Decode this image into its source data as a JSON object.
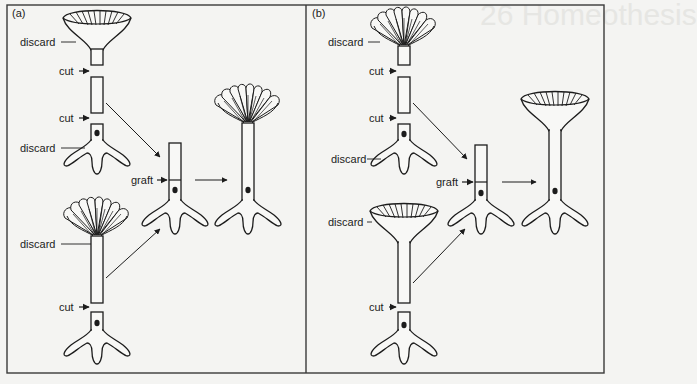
{
  "figure": {
    "colors": {
      "background": "#f4f4f2",
      "ink": "#1c1c1c",
      "frame": "#3a3a3a",
      "bleed_through": "#e6e6e3"
    },
    "bleed_through_heading": "26 Homeothesis",
    "panels": [
      {
        "id": "a",
        "label": "(a)",
        "top_cell": {
          "cap_type": "smooth",
          "labels": {
            "cap_discard": "discard",
            "upper_cut": "cut",
            "lower_cut": "cut",
            "rhizoid_discard": "discard"
          }
        },
        "bottom_cell": {
          "cap_type": "crenulated",
          "labels": {
            "cap_discard": "discard",
            "cut": "cut"
          }
        },
        "graft": {
          "label": "graft"
        },
        "result": {
          "cap_type": "crenulated"
        }
      },
      {
        "id": "b",
        "label": "(b)",
        "top_cell": {
          "cap_type": "crenulated",
          "labels": {
            "cap_discard": "discard",
            "upper_cut": "cut",
            "lower_cut": "cut",
            "rhizoid_discard": "discard"
          }
        },
        "bottom_cell": {
          "cap_type": "smooth",
          "labels": {
            "cap_discard": "discard",
            "cut": "cut"
          }
        },
        "graft": {
          "label": "graft"
        },
        "result": {
          "cap_type": "smooth"
        }
      }
    ]
  }
}
